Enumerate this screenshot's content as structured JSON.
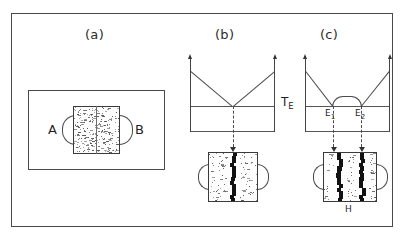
{
  "figure": {
    "frame_color": "#4a4a4a",
    "background": "#ffffff",
    "band_color": "#121212"
  },
  "panels": [
    {
      "id": "a",
      "caption": "(a)",
      "description": "Diffusion couple specimen: two stippled halves in contact inside an outer container, with rounded side lobes",
      "labels": [
        {
          "name": "left-terminal",
          "text": "A"
        },
        {
          "name": "right-terminal",
          "text": "B"
        }
      ]
    },
    {
      "id": "b",
      "caption": "(b)",
      "description": "Simple binary eutectic phase diagram, single eutectic point, projecting to a specimen with one reaction band",
      "eutectic_label": "T",
      "eutectic_sub": "E",
      "eutectic_points": [],
      "band_count": 1
    },
    {
      "id": "c",
      "caption": "(c)",
      "description": "Binary system with intermediate phase dome and two eutectic points, projecting to a specimen with two reaction bands",
      "eutectic_points": [
        {
          "name": "eutectic-1",
          "text": "E",
          "sub": "1"
        },
        {
          "name": "eutectic-2",
          "text": "E",
          "sub": "2"
        }
      ],
      "band_count": 2,
      "phase_label": "H"
    }
  ],
  "chart_data": {
    "type": "line",
    "xlabel": "",
    "ylabel": "",
    "charts": [
      {
        "id": "b",
        "description": "Two liquidus lines descending from pure-component melting points to a single eutectic at the T_E horizontal",
        "x": [
          0,
          50,
          100
        ],
        "liquidus": [
          100,
          0,
          100
        ],
        "eutectic_temperature_line": 0,
        "eutectic_compositions": [
          50
        ],
        "annotations": [
          "T_E"
        ]
      },
      {
        "id": "c",
        "description": "Liquidus descending to eutectic E1, rising over an intermediate-phase dome, then descending to eutectic E2 and rising to the right melting point",
        "x": [
          0,
          32,
          50,
          68,
          100
        ],
        "liquidus": [
          100,
          0,
          22,
          0,
          100
        ],
        "eutectic_temperature_line": 0,
        "eutectic_compositions": [
          32,
          68
        ],
        "annotations": [
          "E1",
          "E2",
          "H"
        ]
      }
    ]
  }
}
